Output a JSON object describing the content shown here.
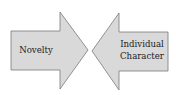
{
  "diagram": {
    "left_arrow": {
      "label": "Novelty",
      "direction": "right"
    },
    "right_arrow": {
      "label_lines": [
        "Individual",
        "Character"
      ],
      "direction": "left"
    },
    "colors": {
      "fill": "#d9d9d9",
      "stroke": "#7a7a7a",
      "text": "#222222"
    }
  }
}
